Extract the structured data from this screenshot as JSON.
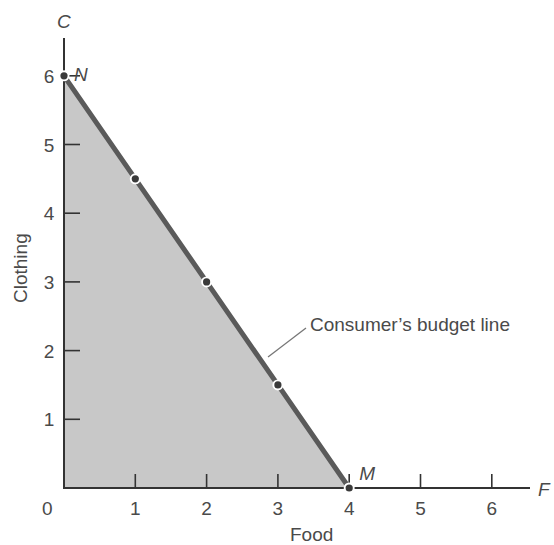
{
  "chart_data": {
    "type": "line",
    "title": "",
    "xlabel": "Food",
    "ylabel": "Clothing",
    "x_axis_letter": "F",
    "y_axis_letter": "C",
    "xlim": [
      0,
      6.5
    ],
    "ylim": [
      0,
      6.5
    ],
    "x_ticks": [
      1,
      2,
      3,
      4,
      5,
      6
    ],
    "y_ticks": [
      1,
      2,
      3,
      4,
      5,
      6
    ],
    "origin_label": "0",
    "grid": false,
    "series": [
      {
        "name": "Consumer's budget line",
        "x": [
          0,
          1,
          2,
          3,
          4
        ],
        "y": [
          6,
          4.5,
          3,
          1.5,
          0
        ]
      }
    ],
    "shaded_region": {
      "description": "Feasible consumption set under budget line",
      "vertices": [
        [
          0,
          0
        ],
        [
          0,
          6
        ],
        [
          4,
          0
        ]
      ],
      "color": "#c8c8c8"
    },
    "point_labels": [
      {
        "label": "N",
        "x": 0,
        "y": 6
      },
      {
        "label": "M",
        "x": 4,
        "y": 0
      }
    ],
    "annotations": [
      {
        "text": "Consumer’s budget line",
        "points_to": [
          2.75,
          1.85
        ]
      }
    ],
    "colors": {
      "line": "#5a5a5a",
      "fill": "#c8c8c8",
      "axis": "#333333",
      "point": "#3a3a3a"
    }
  }
}
